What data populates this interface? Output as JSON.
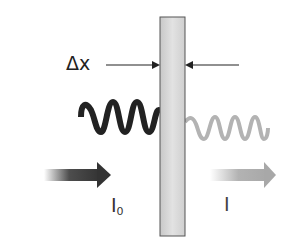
{
  "diagram": {
    "labels": {
      "thickness": "Δx",
      "incident_intensity_main": "I",
      "incident_intensity_sub": "0",
      "transmitted_intensity": "I"
    },
    "elements": {
      "slab": {
        "description": "absorbing material slab of thickness Δx",
        "fill": "#d9d9d9",
        "stroke": "#555555"
      },
      "incident_wave": {
        "description": "incident wave, high amplitude",
        "color": "#222222",
        "cycles": 4
      },
      "transmitted_wave": {
        "description": "transmitted wave, reduced intensity",
        "color": "#b3b3b3",
        "cycles": 4
      },
      "incident_arrow": {
        "description": "incident beam direction",
        "color": "#333333"
      },
      "transmitted_arrow": {
        "description": "transmitted beam direction",
        "color": "#aaaaaa"
      },
      "thickness_arrows": {
        "description": "arrows pointing at slab faces",
        "color": "#222222"
      }
    }
  }
}
